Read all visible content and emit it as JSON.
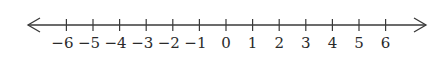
{
  "number_line": {
    "min": -6,
    "max": 6,
    "step": 1,
    "line_color": "#3a3a3a",
    "label_color": "#2a2a2a",
    "arrows": [
      "left",
      "right"
    ],
    "ticks": [
      {
        "value": -6,
        "label": "−6"
      },
      {
        "value": -5,
        "label": "−5"
      },
      {
        "value": -4,
        "label": "−4"
      },
      {
        "value": -3,
        "label": "−3"
      },
      {
        "value": -2,
        "label": "−2"
      },
      {
        "value": -1,
        "label": "−1"
      },
      {
        "value": 0,
        "label": "0"
      },
      {
        "value": 1,
        "label": "1"
      },
      {
        "value": 2,
        "label": "2"
      },
      {
        "value": 3,
        "label": "3"
      },
      {
        "value": 4,
        "label": "4"
      },
      {
        "value": 5,
        "label": "5"
      },
      {
        "value": 6,
        "label": "6"
      }
    ]
  }
}
